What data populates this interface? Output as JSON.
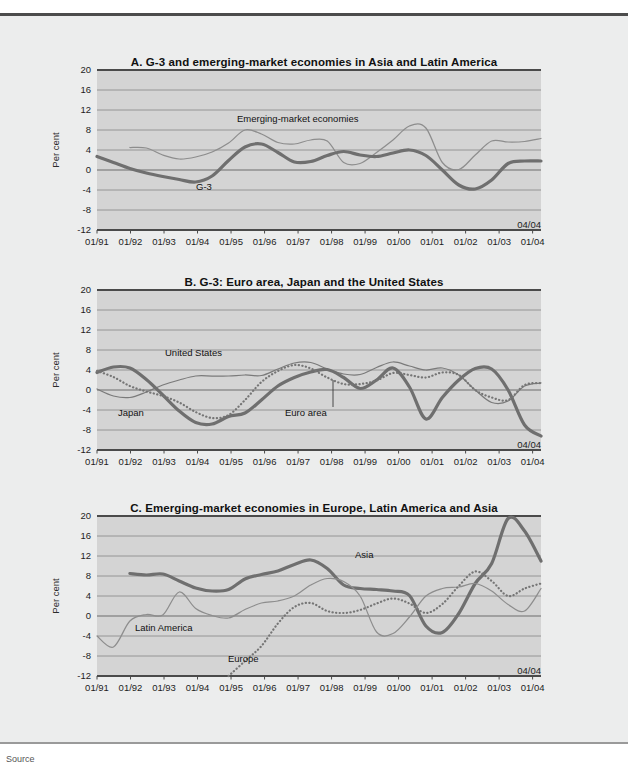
{
  "figure": {
    "background": "#eceded",
    "plot_background": "#d4d4d4",
    "grid_color": "#8f8f8f",
    "axis_color": "#4a4a4a"
  },
  "axis": {
    "ylabel": "Per cent",
    "yticks": [
      "20",
      "16",
      "12",
      "8",
      "4",
      "0",
      "-4",
      "-8",
      "-12"
    ],
    "ytick_values": [
      20,
      16,
      12,
      8,
      4,
      0,
      -4,
      -8,
      -12
    ],
    "xticks": [
      "01/91",
      "01/92",
      "01/93",
      "01/94",
      "01/95",
      "01/96",
      "01/97",
      "01/98",
      "01/99",
      "01/00",
      "01/01",
      "01/02",
      "01/03",
      "01/04"
    ],
    "end_label": "04/04"
  },
  "panels": {
    "a": {
      "title": "A.  G-3 and emerging-market economies in Asia and Latin America",
      "labels": {
        "emerging": "Emerging-market economies",
        "g3": "G-3"
      }
    },
    "b": {
      "title": "B.  G-3: Euro area, Japan and the United States",
      "labels": {
        "us": "United States",
        "japan": "Japan",
        "euro": "Euro area"
      }
    },
    "c": {
      "title": "C.  Emerging-market economies in Europe, Latin America and Asia",
      "labels": {
        "asia": "Asia",
        "latin": "Latin America",
        "europe": "Europe"
      }
    }
  },
  "source": {
    "text": "Source"
  },
  "chart_data": {
    "type": "line",
    "xlabel": "",
    "ylabel": "Per cent",
    "ylim": [
      -12,
      20
    ],
    "xlim": [
      "01/91",
      "04/04"
    ],
    "grid": true,
    "legend": "inline-annotations",
    "x": [
      "01/91",
      "07/91",
      "01/92",
      "07/92",
      "01/93",
      "07/93",
      "01/94",
      "07/94",
      "01/95",
      "07/95",
      "01/96",
      "07/96",
      "01/97",
      "07/97",
      "01/98",
      "07/98",
      "01/99",
      "07/99",
      "01/00",
      "07/00",
      "01/01",
      "07/01",
      "01/02",
      "07/02",
      "01/03",
      "07/03",
      "01/04",
      "04/04"
    ],
    "panels": [
      {
        "id": "A",
        "title": "A.  G-3 and emerging-market economies in Asia and Latin America",
        "series": [
          {
            "name": "Emerging-market economies",
            "style": "thin-line",
            "color": "#8d8d8d",
            "start": "01/92",
            "values": [
              null,
              null,
              4.5,
              4.4,
              3.0,
              2.2,
              2.6,
              3.6,
              5.4,
              8.0,
              7.2,
              5.5,
              5.2,
              6.0,
              5.8,
              1.5,
              1.3,
              3.5,
              6.0,
              8.8,
              8.4,
              1.5,
              0.1,
              3.0,
              5.8,
              5.6,
              5.7,
              6.3
            ]
          },
          {
            "name": "G-3",
            "style": "thick-line",
            "color": "#6f6f6f",
            "values": [
              2.7,
              1.5,
              0.3,
              -0.6,
              -1.3,
              -1.9,
              -2.4,
              -1.2,
              1.9,
              4.6,
              5.2,
              3.5,
              1.6,
              1.7,
              2.9,
              3.7,
              3.0,
              2.7,
              3.4,
              4.0,
              2.9,
              0.0,
              -3.0,
              -3.8,
              -2.0,
              1.3,
              1.8,
              1.8
            ]
          }
        ]
      },
      {
        "id": "B",
        "title": "B.  G-3: Euro area, Japan and the United States",
        "series": [
          {
            "name": "United States",
            "style": "thin-line",
            "color": "#7a7a7a",
            "values": [
              0.2,
              -1.2,
              -1.5,
              -0.4,
              1.0,
              2.0,
              2.8,
              2.8,
              2.8,
              3.0,
              2.9,
              4.2,
              5.4,
              5.5,
              4.2,
              3.2,
              3.1,
              4.5,
              5.6,
              4.8,
              4.0,
              4.4,
              3.0,
              0.0,
              -2.5,
              -2.2,
              0.8,
              1.4
            ]
          },
          {
            "name": "Japan",
            "style": "thick-line",
            "color": "#6f6f6f",
            "values": [
              3.5,
              4.6,
              4.4,
              2.1,
              -1.0,
              -4.2,
              -6.5,
              -6.8,
              -5.3,
              -4.6,
              -2.0,
              0.8,
              2.5,
              3.6,
              4.1,
              2.5,
              0.3,
              2.0,
              4.4,
              0.6,
              -5.8,
              -1.5,
              2.0,
              4.3,
              4.2,
              0.0,
              -7.0,
              -9.2
            ]
          },
          {
            "name": "Euro area",
            "style": "dotted-line",
            "color": "#757575",
            "values": [
              3.8,
              2.6,
              0.8,
              -0.3,
              -1.2,
              -2.5,
              -4.4,
              -5.6,
              -5.0,
              -2.0,
              1.6,
              3.8,
              5.0,
              4.3,
              2.5,
              1.2,
              1.2,
              1.9,
              3.4,
              3.0,
              2.5,
              3.5,
              3.0,
              0.0,
              -1.5,
              -2.0,
              1.0,
              1.4
            ]
          }
        ]
      },
      {
        "id": "C",
        "title": "C.  Emerging-market economies in Europe, Latin America and Asia",
        "series": [
          {
            "name": "Asia",
            "style": "thick-line",
            "color": "#6f6f6f",
            "start": "01/92",
            "values": [
              null,
              null,
              8.5,
              8.2,
              8.4,
              7.0,
              5.6,
              5.0,
              5.3,
              7.4,
              8.3,
              9.0,
              10.3,
              11.2,
              9.5,
              6.2,
              5.5,
              5.3,
              5.0,
              4.1,
              -2.0,
              -3.3,
              0.5,
              6.5,
              10.5,
              19.5,
              17.0,
              11.0
            ]
          },
          {
            "name": "Latin America",
            "style": "thin-line",
            "color": "#8d8d8d",
            "values": [
              -4.0,
              -6.2,
              -1.0,
              0.3,
              0.2,
              4.8,
              1.5,
              0.1,
              -0.4,
              1.3,
              2.6,
              3.0,
              4.0,
              6.2,
              7.5,
              6.9,
              4.0,
              -3.2,
              -3.5,
              -0.2,
              4.0,
              5.5,
              5.8,
              6.5,
              5.0,
              2.3,
              1.0,
              5.5
            ]
          },
          {
            "name": "Europe",
            "style": "dotted-line",
            "color": "#757575",
            "start": "01/95",
            "values": [
              null,
              null,
              null,
              null,
              null,
              null,
              null,
              null,
              -12.0,
              -9.0,
              -6.0,
              -1.5,
              1.8,
              2.6,
              1.0,
              0.6,
              1.2,
              2.5,
              3.5,
              2.5,
              0.6,
              2.4,
              6.0,
              8.9,
              7.0,
              4.0,
              5.5,
              6.5
            ]
          }
        ]
      }
    ]
  }
}
